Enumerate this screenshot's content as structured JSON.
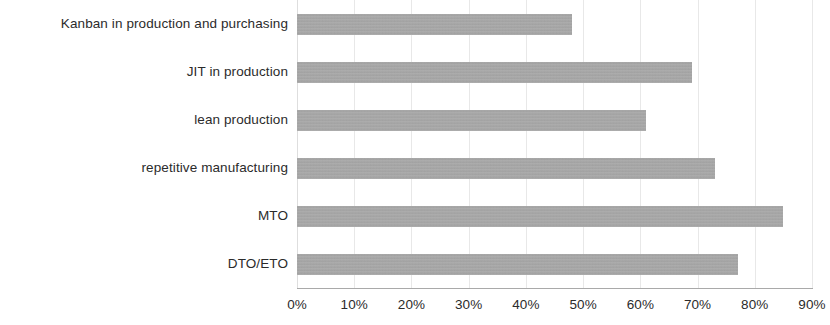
{
  "chart_data": {
    "type": "bar",
    "orientation": "horizontal",
    "title": "",
    "subtitle": "",
    "xlabel": "",
    "ylabel": "",
    "categories": [
      "Kanban in production and purchasing",
      "JIT in production",
      "lean production",
      "repetitive manufacturing",
      "MTO",
      "DTO/ETO"
    ],
    "values": [
      48,
      69,
      61,
      73,
      85,
      77
    ],
    "value_unit": "%",
    "xlim": [
      0,
      90
    ],
    "xtick_labels": [
      "0%",
      "10%",
      "20%",
      "30%",
      "40%",
      "50%",
      "60%",
      "70%",
      "80%",
      "90%"
    ],
    "xtick_values": [
      0,
      10,
      20,
      30,
      40,
      50,
      60,
      70,
      80,
      90
    ],
    "grid": true,
    "grid_axis": "x",
    "legend": false,
    "legend_position": "none",
    "bar_color": "#a8a8a8",
    "gridline_color": "#e8e8e8",
    "axis_color": "#a9a9a9",
    "label_color": "#2b2b2b",
    "background_color": "#ffffff"
  }
}
